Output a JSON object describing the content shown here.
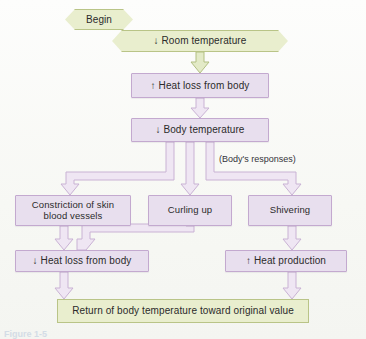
{
  "figure": {
    "caption_fragment": "Figure 1-5"
  },
  "nodes": {
    "begin": {
      "label": "Begin",
      "shape": "hexagon",
      "color": "#e9eece"
    },
    "room_temperature": {
      "label": "↓ Room temperature",
      "shape": "hexagon",
      "color": "#e9eece"
    },
    "heat_loss_increase": {
      "label": "↑ Heat loss from body",
      "shape": "box",
      "color": "#e8dfee"
    },
    "body_temperature": {
      "label": "↓ Body temperature",
      "shape": "box",
      "color": "#e8dfee"
    },
    "responses_label": {
      "label": "(Body's responses)"
    },
    "constriction": {
      "label": "Constriction of skin blood vessels",
      "line1": "Constriction of skin",
      "line2": "blood vessels",
      "shape": "box",
      "color": "#e8dfee"
    },
    "curling_up": {
      "label": "Curling up",
      "shape": "box",
      "color": "#e8dfee"
    },
    "shivering": {
      "label": "Shivering",
      "shape": "box",
      "color": "#e8dfee"
    },
    "heat_loss_decrease": {
      "label": "↓ Heat loss from body",
      "shape": "box",
      "color": "#e8dfee"
    },
    "heat_production": {
      "label": "↑ Heat production",
      "shape": "box",
      "color": "#e8dfee"
    },
    "return_value": {
      "label": "Return of body temperature toward original value",
      "shape": "box",
      "color": "#e9eece"
    }
  },
  "edges": [
    {
      "from": "room_temperature",
      "to": "heat_loss_increase",
      "style": "block-arrow-green"
    },
    {
      "from": "heat_loss_increase",
      "to": "body_temperature",
      "style": "block-arrow"
    },
    {
      "from": "body_temperature",
      "to": "constriction",
      "style": "block-arrow-elbow-left"
    },
    {
      "from": "body_temperature",
      "to": "curling_up",
      "style": "block-arrow"
    },
    {
      "from": "body_temperature",
      "to": "shivering",
      "style": "block-arrow-elbow-right"
    },
    {
      "from": "constriction",
      "to": "heat_loss_decrease",
      "style": "block-arrow"
    },
    {
      "from": "curling_up",
      "to": "heat_loss_decrease",
      "style": "block-arrow-elbow-left"
    },
    {
      "from": "shivering",
      "to": "heat_production",
      "style": "block-arrow"
    },
    {
      "from": "heat_loss_decrease",
      "to": "return_value",
      "style": "block-arrow"
    },
    {
      "from": "heat_production",
      "to": "return_value",
      "style": "block-arrow"
    }
  ],
  "colors": {
    "green_fill": "#e9eece",
    "green_stroke": "#b9c487",
    "purple_fill": "#e8dfee",
    "purple_stroke": "#c3a9cf",
    "arrow_fill": "#efe6f3",
    "arrow_stroke": "#c9b2d4",
    "green_arrow_fill": "#e2e9c6",
    "green_arrow_stroke": "#b2bf82",
    "text": "#2b2b2b"
  }
}
